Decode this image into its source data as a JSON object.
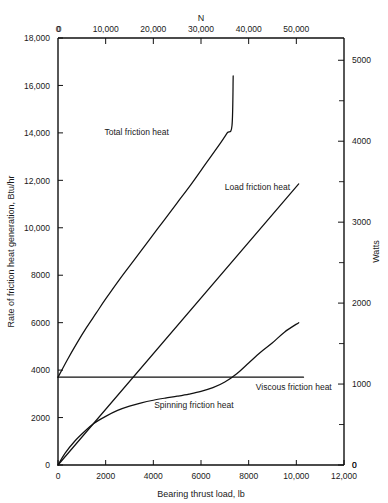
{
  "chart_data": {
    "type": "line",
    "title": "",
    "xlabel": "Bearing thrust load, lb",
    "ylabel": "Rate of friction heat generation, Btu/hr",
    "x2label": "N",
    "y2label": "Watts",
    "xlim": [
      0,
      12000
    ],
    "ylim": [
      0,
      18000
    ],
    "x2lim": [
      0,
      60000
    ],
    "y2lim": [
      0,
      5275
    ],
    "grid": false,
    "legend_position": "inline-annotations",
    "xticks": [
      0,
      2000,
      4000,
      6000,
      8000,
      10000,
      12000
    ],
    "xticklabels": [
      "0",
      "2000",
      "4000",
      "6000",
      "8000",
      "10,000",
      "12,000"
    ],
    "yticks": [
      0,
      2000,
      4000,
      6000,
      8000,
      10000,
      12000,
      14000,
      16000,
      18000
    ],
    "yticklabels": [
      "0",
      "2000",
      "4000",
      "6000",
      "8000",
      "10,000",
      "12,000",
      "14,000",
      "16,000",
      "18,000"
    ],
    "x2ticks": [
      0,
      10000,
      20000,
      30000,
      40000,
      50000
    ],
    "x2ticklabels": [
      "0",
      "10,000",
      "20,000",
      "30,000",
      "40,000",
      "50,000"
    ],
    "y2ticks": [
      0,
      1000,
      2000,
      3000,
      4000,
      5000
    ],
    "y2ticklabels": [
      "0",
      "1000",
      "2000",
      "3000",
      "4000",
      "5000"
    ],
    "y2minorticks": [
      500,
      1500,
      2500,
      3500,
      4500
    ],
    "corner_labels": {
      "top_left_x": "0",
      "bottom_right_zero": "0"
    },
    "series": [
      {
        "name": "Total friction heat",
        "label_x": 3300,
        "label_y": 13900,
        "points": [
          [
            0,
            3700
          ],
          [
            400,
            4450
          ],
          [
            800,
            5150
          ],
          [
            1200,
            5800
          ],
          [
            1600,
            6400
          ],
          [
            2000,
            7000
          ],
          [
            2600,
            7850
          ],
          [
            3200,
            8650
          ],
          [
            3800,
            9450
          ],
          [
            4400,
            10250
          ],
          [
            5000,
            11050
          ],
          [
            5600,
            11850
          ],
          [
            6200,
            12700
          ],
          [
            6800,
            13550
          ],
          [
            7100,
            14000
          ],
          [
            7300,
            14300
          ],
          [
            7350,
            16400
          ]
        ]
      },
      {
        "name": "Load friction heat",
        "label_x": 7000,
        "label_y": 11600,
        "points": [
          [
            0,
            0
          ],
          [
            10100,
            11850
          ]
        ]
      },
      {
        "name": "Viscous friction heat",
        "label_x": 8300,
        "label_y": 3150,
        "points": [
          [
            0,
            3700
          ],
          [
            10300,
            3700
          ]
        ]
      },
      {
        "name": "Spinning friction heat",
        "label_x": 5700,
        "label_y": 2400,
        "points": [
          [
            0,
            0
          ],
          [
            300,
            500
          ],
          [
            700,
            1000
          ],
          [
            1100,
            1400
          ],
          [
            1500,
            1750
          ],
          [
            2000,
            2050
          ],
          [
            2500,
            2300
          ],
          [
            3000,
            2480
          ],
          [
            3500,
            2620
          ],
          [
            4000,
            2730
          ],
          [
            4500,
            2820
          ],
          [
            5000,
            2900
          ],
          [
            5500,
            2990
          ],
          [
            6000,
            3100
          ],
          [
            6500,
            3260
          ],
          [
            7000,
            3500
          ],
          [
            7500,
            3850
          ],
          [
            8000,
            4300
          ],
          [
            8500,
            4750
          ],
          [
            9000,
            5150
          ],
          [
            9500,
            5600
          ],
          [
            10100,
            6000
          ]
        ]
      }
    ]
  },
  "annotations": {
    "total_friction_heat": "Total friction heat",
    "load_friction_heat": "Load friction heat",
    "viscous_friction_heat": "Viscous friction heat",
    "spinning_friction_heat": "Spinning friction heat"
  }
}
